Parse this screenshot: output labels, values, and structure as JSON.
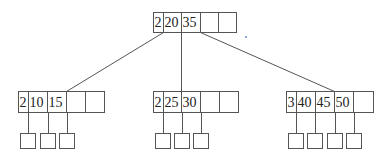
{
  "diagram": {
    "type": "b-tree",
    "colors": {
      "stroke": "#555555",
      "text": "#222222",
      "speck": "#6a8fd0"
    },
    "root": {
      "x": 153,
      "y": 12,
      "h": 20,
      "cells": [
        {
          "label": "2",
          "w": 10
        },
        {
          "label": "20",
          "w": 18
        },
        {
          "label": "35",
          "w": 19
        },
        {
          "label": "",
          "w": 18
        },
        {
          "label": "",
          "w": 18
        }
      ]
    },
    "children": [
      {
        "x": 18,
        "y": 91,
        "h": 21,
        "cells": [
          {
            "label": "2",
            "w": 10
          },
          {
            "label": "10",
            "w": 19
          },
          {
            "label": "15",
            "w": 19
          },
          {
            "label": "",
            "w": 19
          },
          {
            "label": "",
            "w": 19
          }
        ],
        "leaves": [
          20,
          40,
          59
        ]
      },
      {
        "x": 153,
        "y": 91,
        "h": 21,
        "cells": [
          {
            "label": "2",
            "w": 10
          },
          {
            "label": "25",
            "w": 18
          },
          {
            "label": "30",
            "w": 19
          },
          {
            "label": "",
            "w": 19
          },
          {
            "label": "",
            "w": 19
          }
        ],
        "leaves": [
          155,
          174,
          193
        ]
      },
      {
        "x": 286,
        "y": 91,
        "h": 21,
        "cells": [
          {
            "label": "3",
            "w": 10
          },
          {
            "label": "40",
            "w": 19
          },
          {
            "label": "45",
            "w": 19
          },
          {
            "label": "50",
            "w": 19
          },
          {
            "label": "",
            "w": 20
          }
        ],
        "leaves": [
          288,
          307,
          327,
          346
        ]
      }
    ],
    "leaf": {
      "y": 133,
      "w": 15,
      "h": 15
    }
  }
}
